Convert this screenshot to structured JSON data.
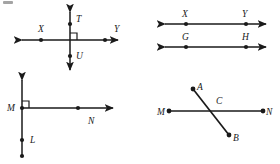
{
  "page": {
    "background_color": "#ffffff",
    "ink_color": "#1a1a1a",
    "width": 280,
    "height": 164
  },
  "figures": [
    {
      "id": "figure-1",
      "name": "perpendicular-lines-TU-XY",
      "description": "Two perpendicular lines intersecting at a right angle",
      "right_angle_marker": true,
      "labels": [
        {
          "key": "t",
          "text": "T",
          "x": 76,
          "y": 22
        },
        {
          "key": "x",
          "text": "X",
          "x": 38,
          "y": 32
        },
        {
          "key": "y",
          "text": "Y",
          "x": 114,
          "y": 32
        },
        {
          "key": "u",
          "text": "U",
          "x": 76,
          "y": 59
        }
      ]
    },
    {
      "id": "figure-2",
      "name": "parallel-lines-XY-GH",
      "description": "Two parallel lines with labeled points",
      "right_angle_marker": false,
      "labels": [
        {
          "key": "x",
          "text": "X",
          "x": 182,
          "y": 17
        },
        {
          "key": "y",
          "text": "Y",
          "x": 242,
          "y": 17
        },
        {
          "key": "g",
          "text": "G",
          "x": 182,
          "y": 40
        },
        {
          "key": "h",
          "text": "H",
          "x": 242,
          "y": 40
        }
      ]
    },
    {
      "id": "figure-3",
      "name": "perpendicular-ray-MN-segment-ML",
      "description": "A ray MN meeting a vertical line at M at a right angle",
      "right_angle_marker": true,
      "labels": [
        {
          "key": "m",
          "text": "M",
          "x": 7,
          "y": 111
        },
        {
          "key": "n",
          "text": "N",
          "x": 88,
          "y": 124
        },
        {
          "key": "l",
          "text": "L",
          "x": 30,
          "y": 143
        }
      ]
    },
    {
      "id": "figure-4",
      "name": "intersecting-segments-AB-MN",
      "description": "Segment AB crossing segment MN at point C (not perpendicular)",
      "right_angle_marker": false,
      "labels": [
        {
          "key": "a",
          "text": "A",
          "x": 197,
          "y": 90
        },
        {
          "key": "c",
          "text": "C",
          "x": 216,
          "y": 104
        },
        {
          "key": "m",
          "text": "M",
          "x": 158,
          "y": 115
        },
        {
          "key": "n",
          "text": "N",
          "x": 266,
          "y": 115
        },
        {
          "key": "b",
          "text": "B",
          "x": 233,
          "y": 141
        }
      ]
    }
  ],
  "marks": {
    "corner_artifact": "scan-smudge"
  }
}
